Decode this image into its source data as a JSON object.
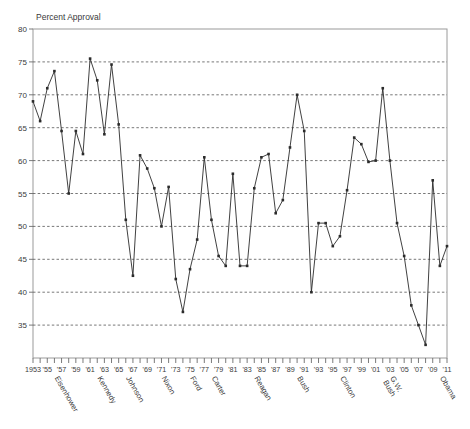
{
  "chart_data": {
    "type": "line",
    "title": "",
    "axis_title": "Percent Approval",
    "xlabel": "",
    "ylabel": "Percent Approval",
    "ylim": [
      30,
      80
    ],
    "xlim": [
      1953,
      2011
    ],
    "ytick_labels": [
      "80",
      "75",
      "70",
      "65",
      "60",
      "55",
      "50",
      "45",
      "40",
      "35"
    ],
    "ytick_values": [
      80,
      75,
      70,
      65,
      60,
      55,
      50,
      45,
      40,
      35
    ],
    "grid": "horizontal-dashed",
    "legend": "none",
    "marker": "square",
    "line_color": "#2b2b2b",
    "grid_color": "#555555",
    "frame_color": "#9a9a9a",
    "xtick_labels": [
      "1953",
      "'55",
      "'57",
      "'59",
      "'61",
      "'63",
      "'65",
      "'67",
      "'69",
      "'71",
      "'73",
      "'75",
      "'77",
      "'79",
      "'81",
      "'83",
      "'85",
      "'87",
      "'89",
      "'91",
      "'93",
      "'95",
      "'97",
      "'99",
      "'01",
      "'03",
      "'05",
      "'07",
      "'09",
      "'11"
    ],
    "xtick_years": [
      1953,
      1955,
      1957,
      1959,
      1961,
      1963,
      1965,
      1967,
      1969,
      1971,
      1973,
      1975,
      1977,
      1979,
      1981,
      1983,
      1985,
      1987,
      1989,
      1991,
      1993,
      1995,
      1997,
      1999,
      2001,
      2003,
      2005,
      2007,
      2009,
      2011
    ],
    "presidents": [
      {
        "name": "Eisenhower",
        "year": 1956
      },
      {
        "name": "Kennedy",
        "year": 1962
      },
      {
        "name": "Johnson",
        "year": 1966
      },
      {
        "name": "Nixon",
        "year": 1971
      },
      {
        "name": "Ford",
        "year": 1975
      },
      {
        "name": "Carter",
        "year": 1978
      },
      {
        "name": "Reagan",
        "year": 1984
      },
      {
        "name": "Bush",
        "year": 1990
      },
      {
        "name": "Clinton",
        "year": 1996
      },
      {
        "name": "G.W. Bush",
        "year": 2003
      },
      {
        "name": "Obama",
        "year": 2010
      }
    ],
    "x": [
      1953,
      1954,
      1955,
      1956,
      1957,
      1958,
      1959,
      1960,
      1961,
      1962,
      1963,
      1964,
      1965,
      1966,
      1967,
      1968,
      1969,
      1970,
      1971,
      1972,
      1973,
      1974,
      1975,
      1976,
      1977,
      1978,
      1979,
      1980,
      1981,
      1982,
      1983,
      1984,
      1985,
      1986,
      1987,
      1988,
      1989,
      1990,
      1991,
      1992,
      1993,
      1994,
      1995,
      1996,
      1997,
      1998,
      1999,
      2000,
      2001,
      2002,
      2003,
      2004,
      2005,
      2006,
      2007,
      2008,
      2009,
      2010,
      2011
    ],
    "values": [
      69.0,
      66.0,
      71.0,
      73.6,
      64.5,
      55.0,
      64.5,
      61.0,
      75.5,
      72.2,
      64.0,
      74.6,
      65.5,
      51.0,
      42.5,
      60.8,
      58.8,
      55.8,
      50.0,
      56.0,
      42.0,
      37.0,
      43.5,
      48.0,
      60.5,
      51.0,
      45.5,
      44.0,
      58.0,
      44.0,
      44.0,
      55.8,
      60.5,
      61.0,
      52.0,
      54.0,
      62.0,
      70.0,
      64.5,
      40.0,
      50.5,
      50.5,
      47.0,
      48.5,
      55.5,
      63.5,
      62.5,
      59.8,
      60.0,
      71.0,
      60.0,
      50.5,
      45.5,
      38.0,
      35.0,
      32.0,
      57.0,
      44.0,
      47.0
    ]
  }
}
